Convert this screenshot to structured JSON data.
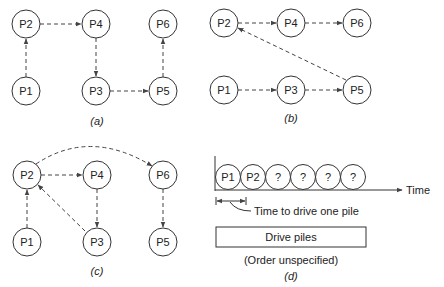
{
  "panels": {
    "a": {
      "caption": "(a)",
      "nodes": [
        {
          "id": "P1",
          "label": "P1",
          "x": 26,
          "y": 91
        },
        {
          "id": "P2",
          "label": "P2",
          "x": 26,
          "y": 24
        },
        {
          "id": "P3",
          "label": "P3",
          "x": 96,
          "y": 91
        },
        {
          "id": "P4",
          "label": "P4",
          "x": 96,
          "y": 24
        },
        {
          "id": "P5",
          "label": "P5",
          "x": 163,
          "y": 91
        },
        {
          "id": "P6",
          "label": "P6",
          "x": 163,
          "y": 24
        }
      ],
      "edges": [
        [
          "P1",
          "P2"
        ],
        [
          "P2",
          "P4"
        ],
        [
          "P4",
          "P3"
        ],
        [
          "P3",
          "P5"
        ],
        [
          "P5",
          "P6"
        ]
      ]
    },
    "b": {
      "caption": "(b)",
      "nodes": [
        {
          "id": "P1",
          "label": "P1",
          "x": 224,
          "y": 90
        },
        {
          "id": "P2",
          "label": "P2",
          "x": 224,
          "y": 23
        },
        {
          "id": "P3",
          "label": "P3",
          "x": 291,
          "y": 90
        },
        {
          "id": "P4",
          "label": "P4",
          "x": 291,
          "y": 23
        },
        {
          "id": "P5",
          "label": "P5",
          "x": 357,
          "y": 90
        },
        {
          "id": "P6",
          "label": "P6",
          "x": 357,
          "y": 23
        }
      ],
      "edges": [
        [
          "P2",
          "P4"
        ],
        [
          "P4",
          "P6"
        ],
        [
          "P1",
          "P3"
        ],
        [
          "P3",
          "P5"
        ],
        [
          "P5",
          "P2"
        ]
      ]
    },
    "c": {
      "caption": "(c)",
      "nodes": [
        {
          "id": "P1",
          "label": "P1",
          "x": 27,
          "y": 242
        },
        {
          "id": "P2",
          "label": "P2",
          "x": 27,
          "y": 175
        },
        {
          "id": "P3",
          "label": "P3",
          "x": 97,
          "y": 242
        },
        {
          "id": "P4",
          "label": "P4",
          "x": 97,
          "y": 175
        },
        {
          "id": "P5",
          "label": "P5",
          "x": 163,
          "y": 242
        },
        {
          "id": "P6",
          "label": "P6",
          "x": 163,
          "y": 175
        }
      ],
      "edges": [
        [
          "P1",
          "P2"
        ],
        [
          "P2",
          "P4"
        ],
        [
          "P4",
          "P3"
        ],
        [
          "P3",
          "P2"
        ],
        [
          "P2",
          "P6",
          "curved"
        ],
        [
          "P6",
          "P5"
        ]
      ]
    },
    "d": {
      "caption": "(d)",
      "sequence": [
        "P1",
        "P2",
        "?",
        "?",
        "?",
        "?"
      ],
      "axis_label": "Time",
      "dimension_label": "Time to drive one pile",
      "box_label": "Drive piles",
      "note": "(Order unspecified)"
    }
  }
}
